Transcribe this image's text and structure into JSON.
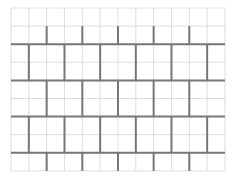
{
  "diagram": {
    "type": "brick-pattern-grid",
    "background": "#ffffff",
    "grid": {
      "x0": 11,
      "y0": 8,
      "cols": 12,
      "rows": 9,
      "cell_w": 17.83,
      "cell_h": 18.1,
      "thin_color": "#d4d4d4",
      "thin_width": 0.8
    },
    "bricks": {
      "color": "#777777",
      "width": 2,
      "horizontal_rows": [
        2,
        4,
        6,
        8
      ],
      "bands": [
        {
          "row_start": 1,
          "row_end": 2,
          "vertical_cols": [
            2,
            4,
            6,
            8,
            10
          ]
        },
        {
          "row_start": 2,
          "row_end": 4,
          "vertical_cols": [
            1,
            3,
            5,
            7,
            9,
            11
          ]
        },
        {
          "row_start": 4,
          "row_end": 6,
          "vertical_cols": [
            2,
            4,
            6,
            8,
            10
          ]
        },
        {
          "row_start": 6,
          "row_end": 8,
          "vertical_cols": [
            1,
            3,
            5,
            7,
            9,
            11
          ]
        },
        {
          "row_start": 8,
          "row_end": 9,
          "vertical_cols": [
            2,
            4,
            6,
            8,
            10
          ]
        }
      ]
    }
  }
}
